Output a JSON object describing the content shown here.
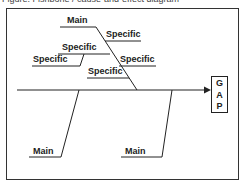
{
  "caption": "Figure: Fishbone / cause-and-effect diagram",
  "diagram": {
    "effect_box": {
      "letters": [
        "G",
        "A",
        "P"
      ]
    },
    "top_main": {
      "label": "Main"
    },
    "top_specifics": [
      {
        "label": "Specific"
      },
      {
        "label": "Specific"
      },
      {
        "label": "Specific"
      },
      {
        "label": "Specific"
      },
      {
        "label": "Specific"
      }
    ],
    "bottom_mains": [
      {
        "label": "Main"
      },
      {
        "label": "Main"
      }
    ]
  }
}
